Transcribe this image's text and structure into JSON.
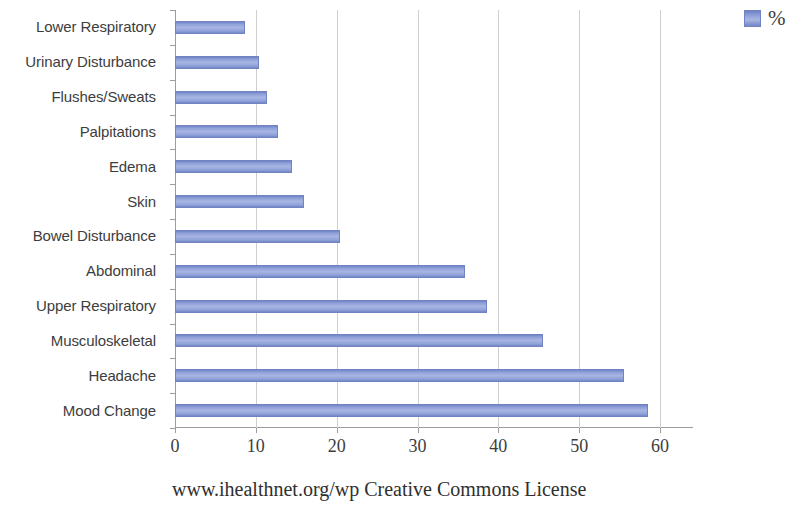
{
  "chart_data": {
    "type": "bar",
    "orientation": "horizontal",
    "title": "",
    "xlabel": "",
    "ylabel": "",
    "xlim": [
      0,
      60
    ],
    "xticks": [
      0,
      10,
      20,
      30,
      40,
      50,
      60
    ],
    "grid": true,
    "legend": {
      "position": "top-right",
      "entries": [
        {
          "name": "%",
          "color": "#9aaade"
        }
      ]
    },
    "series": [
      {
        "name": "%",
        "color": "#9aaade",
        "values": [
          8.6,
          10.4,
          11.4,
          12.7,
          14.5,
          16.0,
          20.4,
          35.9,
          38.6,
          45.5,
          55.6,
          58.5
        ]
      }
    ],
    "categories": [
      "Lower Respiratory",
      "Urinary Disturbance",
      "Flushes/Sweats",
      "Palpitations",
      "Edema",
      "Skin",
      "Bowel Disturbance",
      "Abdominal",
      "Upper Respiratory",
      "Musculoskeletal",
      "Headache",
      "Mood Change"
    ]
  },
  "footer": {
    "text": "www.ihealthnet.org/wp Creative Commons License"
  }
}
